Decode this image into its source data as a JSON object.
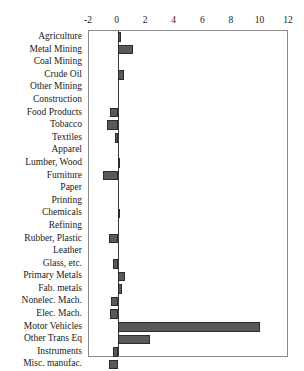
{
  "chart_data": {
    "type": "bar",
    "orientation": "horizontal",
    "title": "",
    "subtitle": "",
    "xlabel": "",
    "ylabel": "",
    "xlim": [
      -2,
      12
    ],
    "xticks": [
      -2,
      0,
      2,
      4,
      6,
      8,
      10,
      12
    ],
    "xtick_labels": [
      "-2",
      "0",
      "2",
      "4",
      "6",
      "8",
      "10",
      "12"
    ],
    "grid": false,
    "legend": null,
    "bar_color": "#595959",
    "bar_edge_color": "#2b2b2b",
    "frame_color": "#8a8a8a",
    "zero_line_color": "#3a3a3a",
    "categories": [
      "Agriculture",
      "Metal Mining",
      "Coal Mining",
      "Crude Oil",
      "Other Mining",
      "Construction",
      "Food Products",
      "Tobacco",
      "Textiles",
      "Apparel",
      "Lumber, Wood",
      "Furniture",
      "Paper",
      "Printing",
      "Chemicals",
      "Refining",
      "Rubber, Plastic",
      "Leather",
      "Glass, etc.",
      "Primary Metals",
      "Fab. metals",
      "Nonelec. Mach.",
      "Elec. Mach.",
      "Motor Vehicles",
      "Other Trans Eq",
      "Instruments",
      "Misc. manufac."
    ],
    "values": [
      0.25,
      1.05,
      0.0,
      0.45,
      0.0,
      0.0,
      -0.55,
      -0.75,
      -0.2,
      0.0,
      0.2,
      -1.05,
      0.0,
      0.0,
      0.05,
      0.0,
      -0.6,
      0.0,
      -0.35,
      0.55,
      0.3,
      -0.45,
      -0.55,
      10.0,
      2.3,
      -0.3,
      -0.6
    ]
  }
}
